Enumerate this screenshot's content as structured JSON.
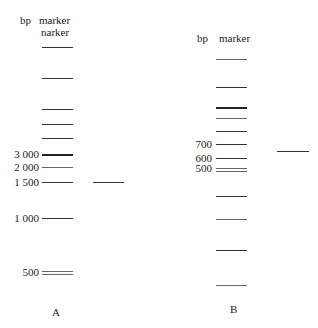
{
  "panels": [
    {
      "id": "A",
      "label": "A",
      "header_bp": "bp",
      "header_marker": "marker",
      "header_marker2": "narker",
      "marker_bands": [
        {
          "y": 47,
          "label": ""
        },
        {
          "y": 78,
          "label": ""
        },
        {
          "y": 109,
          "label": ""
        },
        {
          "y": 124,
          "label": ""
        },
        {
          "y": 138,
          "label": ""
        },
        {
          "y": 154,
          "label": "3 000",
          "thick": true
        },
        {
          "y": 167,
          "label": "2 000",
          "gray": true
        },
        {
          "y": 182,
          "label": "1 500"
        },
        {
          "y": 218,
          "label": "1 000"
        },
        {
          "y": 271,
          "label": "500",
          "gray": true
        },
        {
          "y": 274,
          "label": "",
          "gray": true
        }
      ],
      "sample_band": {
        "y": 182
      }
    },
    {
      "id": "B",
      "label": "B",
      "header_bp": "bp",
      "header_marker": "marker",
      "marker_bands": [
        {
          "y": 59,
          "label": "",
          "gray": true
        },
        {
          "y": 87,
          "label": ""
        },
        {
          "y": 107,
          "label": "",
          "thick": true
        },
        {
          "y": 118,
          "label": "",
          "gray": true
        },
        {
          "y": 131,
          "label": ""
        },
        {
          "y": 144,
          "label": "700"
        },
        {
          "y": 158,
          "label": "600"
        },
        {
          "y": 168,
          "label": "500",
          "gray": true
        },
        {
          "y": 171,
          "label": "",
          "gray": true
        },
        {
          "y": 196,
          "label": ""
        },
        {
          "y": 219,
          "label": "",
          "gray": true
        },
        {
          "y": 250,
          "label": ""
        },
        {
          "y": 285,
          "label": "",
          "gray": true
        }
      ],
      "sample_band": {
        "y": 151
      }
    }
  ]
}
